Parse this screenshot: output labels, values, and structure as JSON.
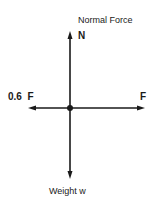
{
  "diagram": {
    "labels": {
      "normal_force": "Normal Force",
      "normal_symbol": "N",
      "friction": "0.6  F",
      "applied": "F",
      "weight": "Weight w"
    },
    "colors": {
      "line": "#1a1a1a",
      "background": "#ffffff"
    }
  }
}
